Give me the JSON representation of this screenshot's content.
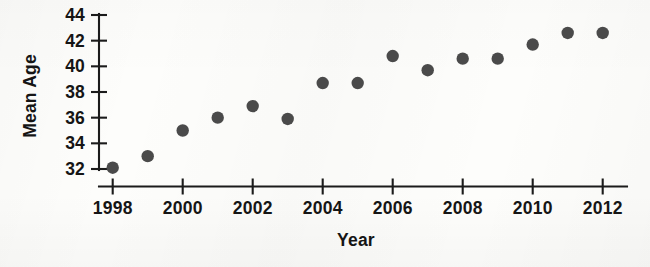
{
  "chart_data": {
    "type": "scatter",
    "title": "",
    "xlabel": "Year",
    "ylabel": "Mean Age",
    "x": [
      1998,
      1999,
      2000,
      2001,
      2002,
      2003,
      2004,
      2005,
      2006,
      2007,
      2008,
      2009,
      2010,
      2011,
      2012
    ],
    "values": [
      32.1,
      33.0,
      35.0,
      36.0,
      36.9,
      35.9,
      38.7,
      38.7,
      40.8,
      39.7,
      40.6,
      40.6,
      41.7,
      42.6,
      42.6
    ],
    "series": [
      {
        "name": "Mean Age",
        "values": [
          32.1,
          33.0,
          35.0,
          36.0,
          36.9,
          35.9,
          38.7,
          38.7,
          40.8,
          39.7,
          40.6,
          40.6,
          41.7,
          42.6,
          42.6
        ]
      }
    ],
    "xlim": [
      1998,
      2012
    ],
    "ylim": [
      32,
      44
    ],
    "x_ticks": [
      1998,
      2000,
      2002,
      2004,
      2006,
      2008,
      2010,
      2012
    ],
    "x_tick_labels": [
      "1998",
      "2000",
      "2002",
      "2004",
      "2006",
      "2008",
      "2010",
      "2012"
    ],
    "y_ticks": [
      32,
      34,
      36,
      38,
      40,
      42,
      44
    ],
    "y_tick_labels": [
      "32",
      "34",
      "36",
      "38",
      "40",
      "42",
      "44"
    ],
    "grid": false,
    "legend": false,
    "legend_position": "none",
    "marker_style": "filled-circle",
    "marker_color": "#4a4a4a",
    "axis_color": "#1b1b1b"
  }
}
